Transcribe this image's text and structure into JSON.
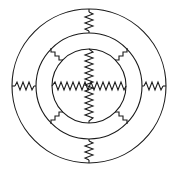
{
  "figure": {
    "background_color": "#ffffff",
    "stroke_color": "#1a1a1a",
    "stroke_width": 1.1,
    "canvas": {
      "width": 177,
      "height": 170
    },
    "center": {
      "x": 89,
      "y": 86
    }
  },
  "rings": [
    {
      "name": "outer-ring",
      "radius": 77,
      "label": "outer circle"
    },
    {
      "name": "middle-ring",
      "radius": 53,
      "label": "middle circle"
    },
    {
      "name": "inner-ring",
      "radius": 37,
      "label": "inner circle"
    }
  ],
  "connectors": {
    "outer_to_middle": [
      {
        "name": "connector-top",
        "orientation": "vertical",
        "angle_deg": 270,
        "zigzag_segments": 6
      },
      {
        "name": "connector-bottom",
        "orientation": "vertical",
        "angle_deg": 90,
        "zigzag_segments": 6
      },
      {
        "name": "connector-left",
        "orientation": "horizontal",
        "angle_deg": 180,
        "zigzag_segments": 6
      },
      {
        "name": "connector-right",
        "orientation": "horizontal",
        "angle_deg": 0,
        "zigzag_segments": 6
      }
    ],
    "middle_to_inner": [
      {
        "name": "connector-upper-left",
        "orientation": "diagonal",
        "angle_deg": 225,
        "zigzag_segments": 4
      },
      {
        "name": "connector-upper-right",
        "orientation": "diagonal",
        "angle_deg": 315,
        "zigzag_segments": 4
      },
      {
        "name": "connector-lower-left",
        "orientation": "diagonal",
        "angle_deg": 135,
        "zigzag_segments": 4
      },
      {
        "name": "connector-lower-right",
        "orientation": "diagonal",
        "angle_deg": 45,
        "zigzag_segments": 4
      }
    ],
    "inner_spokes": [
      {
        "name": "spoke-vertical",
        "orientation": "vertical",
        "zigzag_segments": 12
      },
      {
        "name": "spoke-horizontal",
        "orientation": "horizontal",
        "zigzag_segments": 12
      }
    ]
  },
  "chart_data": {
    "type": "diagram",
    "elements": 3,
    "resistor_count": 10
  }
}
